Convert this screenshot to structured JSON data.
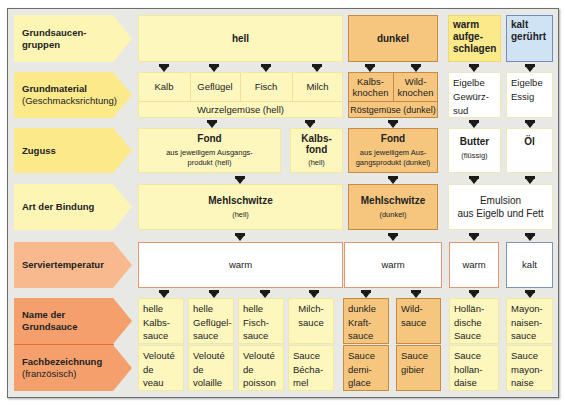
{
  "rows": {
    "gruppen": {
      "label": "Grundsaucen-",
      "label2": "gruppen"
    },
    "grundmaterial": {
      "label": "Grundmaterial",
      "sub": "(Geschmacksrichtung)"
    },
    "zuguss": {
      "label": "Zuguss"
    },
    "bindung": {
      "label": "Art der Bindung"
    },
    "servier": {
      "label": "Serviertemperatur"
    },
    "name": {
      "label": "Name der",
      "label2": "Grundsauce"
    },
    "fach": {
      "label": "Fachbezeichnung",
      "sub": "(französisch)"
    }
  },
  "groups": {
    "hell": "hell",
    "dunkel": "dunkel",
    "warm_aufgeschlagen": [
      "warm",
      "aufge-",
      "schlagen"
    ],
    "kalt_geruehrt": [
      "kalt",
      "gerührt"
    ]
  },
  "grundmaterial": {
    "hell": [
      "Kalb",
      "Geflügel",
      "Fisch",
      "Milch"
    ],
    "hell_base": "Wurzelgemüse (hell)",
    "dunkel": [
      [
        "Kalbs-",
        "knochen"
      ],
      [
        "Wild-",
        "knochen"
      ]
    ],
    "dunkel_base": "Röstgemüse (dunkel)",
    "warm": [
      "Eigelbe",
      "Gewürz-",
      "sud"
    ],
    "kalt": [
      "Eigelbe",
      "Essig"
    ]
  },
  "zuguss": {
    "hell_fond": {
      "title": "Fond",
      "sub1": "aus jeweiligem Ausgangs-",
      "sub2": "produkt (hell)"
    },
    "kalbsfond": {
      "title1": "Kalbs-",
      "title2": "fond",
      "sub": "(hell)"
    },
    "dunkel_fond": {
      "title": "Fond",
      "sub1": "aus jeweiligem Aus-",
      "sub2": "gangsprodukt (dunkel)"
    },
    "butter": {
      "title": "Butter",
      "sub": "(flüssig)"
    },
    "oel": {
      "title": "Öl"
    }
  },
  "bindung": {
    "hell": {
      "title": "Mehlschwitze",
      "sub": "(hell)"
    },
    "dunkel": {
      "title": "Mehlschwitze",
      "sub": "(dunkel)"
    },
    "emulsion": {
      "line1": "Emulsion",
      "line2": "aus Eigelb und Fett"
    }
  },
  "servier": {
    "hell": "warm",
    "dunkel": "warm",
    "warm": "warm",
    "kalt": "kalt"
  },
  "names": [
    [
      "helle",
      "Kalbs-",
      "sauce"
    ],
    [
      "helle",
      "Geflügel-",
      "sauce"
    ],
    [
      "helle",
      "Fisch-",
      "sauce"
    ],
    [
      "Milch-",
      "sauce",
      ""
    ],
    [
      "dunkle",
      "Kraft-",
      "sauce"
    ],
    [
      "Wild-",
      "sauce",
      ""
    ],
    [
      "Hollän-",
      "dische",
      "Sauce"
    ],
    [
      "Mayon-",
      "naisen-",
      "sauce"
    ]
  ],
  "fach": [
    [
      "Velouté",
      "de",
      "veau"
    ],
    [
      "Velouté",
      "de",
      "volaille"
    ],
    [
      "Velouté",
      "de",
      "poisson"
    ],
    [
      "Sauce",
      "Bécha-",
      "mel"
    ],
    [
      "Sauce",
      "demi-",
      "glace"
    ],
    [
      "Sauce",
      "gibier",
      ""
    ],
    [
      "Sauce",
      "hollan-",
      "daise"
    ],
    [
      "Sauce",
      "mayon-",
      "naise"
    ]
  ],
  "colors": {
    "hell": "#fdf7bd",
    "dunkel": "#f6c67e",
    "warm_aufgeschlagen": "#fce98a",
    "kalt": "#cfe3f5",
    "label_orange": "#f5a06c",
    "frame_bg": "#e8e8e4"
  }
}
